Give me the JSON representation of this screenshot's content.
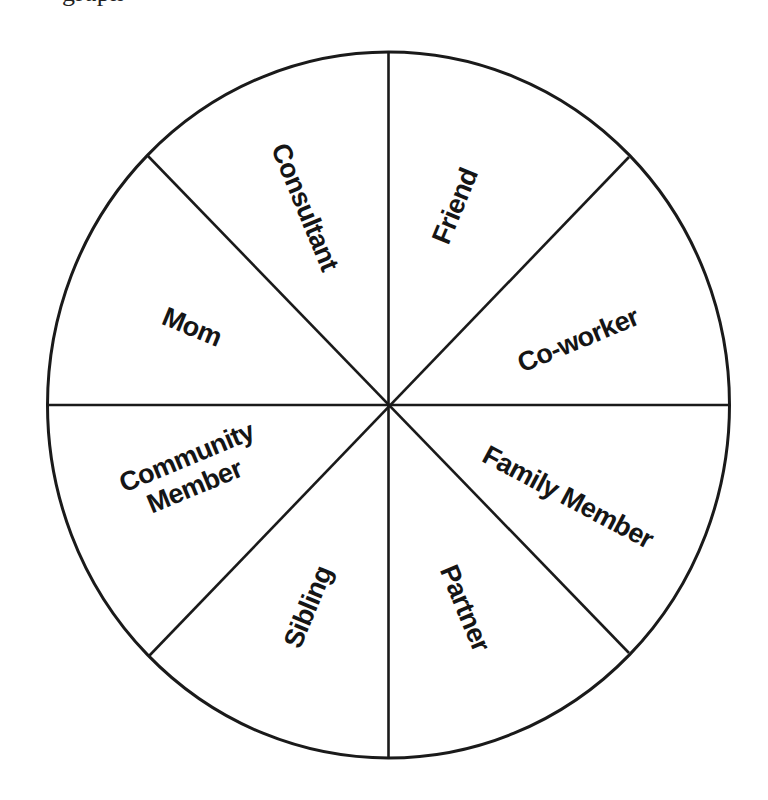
{
  "top_fragment": {
    "text": "graph"
  },
  "wheel": {
    "stroke_color": "#1a1a1a",
    "text_color": "#151515",
    "background": "#ffffff",
    "segments": [
      {
        "label": "Friend",
        "lines": [
          "Friend"
        ]
      },
      {
        "label": "Co-worker",
        "lines": [
          "Co-worker"
        ]
      },
      {
        "label": "Family Member",
        "lines": [
          "Family Member"
        ]
      },
      {
        "label": "Partner",
        "lines": [
          "Partner"
        ]
      },
      {
        "label": "Sibling",
        "lines": [
          "Sibling"
        ]
      },
      {
        "label": "Community Member",
        "lines": [
          "Community",
          "Member"
        ]
      },
      {
        "label": "Mom",
        "lines": [
          "Mom"
        ]
      },
      {
        "label": "Consultant",
        "lines": [
          "Consultant"
        ]
      }
    ]
  }
}
